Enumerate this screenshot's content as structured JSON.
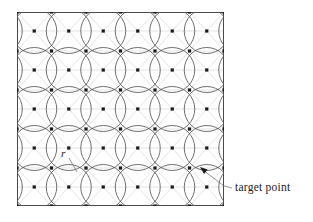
{
  "figure": {
    "type": "geometric-diagram",
    "title": "",
    "labels": {
      "radius": "r",
      "target_point": "target point"
    },
    "colors": {
      "frame": "#4a4a4a",
      "circle": "#555555",
      "lattice_line": "#d8d8d8",
      "dot": "#1b1b1b",
      "leader": "#666666",
      "background": "#ffffff"
    },
    "frame": {
      "x": 17,
      "y": 12,
      "width": 207,
      "height": 194
    },
    "geometry": {
      "circle_radius": 22.5,
      "column_spacing": 34.5,
      "row_spacing": 39,
      "circle_row_ys": [
        31,
        70,
        109,
        148,
        187
      ],
      "dot_row_ys": [
        12,
        31,
        51,
        70,
        90,
        109,
        129,
        148,
        168,
        187,
        206
      ]
    },
    "annotations": {
      "radius_leader_from": [
        69,
        157
      ],
      "radius_leader_to": [
        76,
        172
      ],
      "radius_label_pos": [
        63,
        156
      ],
      "arrow_tip": [
        200,
        167
      ],
      "arrow_tail": [
        224,
        186
      ],
      "target_label_pos": [
        234,
        191
      ]
    }
  },
  "chart_data": {
    "type": "scatter",
    "xlabel": "",
    "ylabel": "",
    "xlim": [
      0,
      207
    ],
    "ylim": [
      0,
      194
    ],
    "grid": true,
    "legend": null,
    "annotations": [
      "r",
      "target point"
    ],
    "series": [
      {
        "name": "lattice target points",
        "marker": "square-dot",
        "note": "points on a triangular lattice, 7 columns x 11 staggered rows"
      },
      {
        "name": "covering circles",
        "marker": "circle-outline",
        "radius": 22.5,
        "note": "circles of radius r centered at alternating lattice rows"
      }
    ]
  }
}
